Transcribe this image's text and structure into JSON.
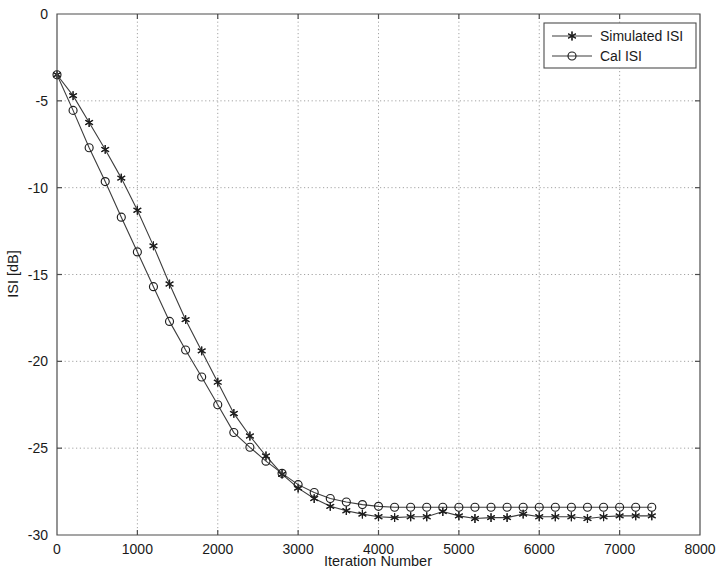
{
  "chart_data": {
    "type": "line",
    "title": "",
    "xlabel": "Iteration Number",
    "ylabel": "ISI [dB]",
    "xlim": [
      0,
      8000
    ],
    "ylim": [
      -30,
      0
    ],
    "xticks": [
      0,
      1000,
      2000,
      3000,
      4000,
      5000,
      6000,
      7000,
      8000
    ],
    "xtick_labels": [
      "0",
      "1000",
      "2000",
      "3000",
      "4000",
      "5000",
      "6000",
      "7000",
      "8000"
    ],
    "yticks": [
      0,
      -5,
      -10,
      -15,
      -20,
      -25,
      -30
    ],
    "ytick_labels": [
      "0",
      "-5",
      "-10",
      "-15",
      "-20",
      "-25",
      "-30"
    ],
    "grid": true,
    "grid_style": "dotted",
    "legend_position": "top-right",
    "line_color": "#3d3d3d",
    "marker_color": "#1f1f1f",
    "marker_interval": 200,
    "series": [
      {
        "name": "Simulated ISI",
        "marker": "star",
        "x": [
          0,
          200,
          400,
          600,
          800,
          1000,
          1200,
          1400,
          1600,
          1800,
          2000,
          2200,
          2400,
          2600,
          2800,
          3000,
          3200,
          3400,
          3600,
          3800,
          4000,
          4200,
          4400,
          4600,
          4800,
          5000,
          5200,
          5400,
          5600,
          5800,
          6000,
          6200,
          6400,
          6600,
          6800,
          7000,
          7200,
          7400
        ],
        "values": [
          -3.5,
          -4.7,
          -6.25,
          -7.8,
          -9.45,
          -11.3,
          -13.35,
          -15.55,
          -17.6,
          -19.4,
          -21.2,
          -23.0,
          -24.3,
          -25.45,
          -26.5,
          -27.3,
          -27.9,
          -28.35,
          -28.6,
          -28.8,
          -28.95,
          -29.0,
          -28.95,
          -28.95,
          -28.65,
          -28.9,
          -29.05,
          -29.0,
          -29.0,
          -28.8,
          -28.95,
          -28.95,
          -28.95,
          -29.05,
          -28.95,
          -28.9,
          -28.9,
          -28.9
        ]
      },
      {
        "name": "Cal ISI",
        "marker": "circle",
        "x": [
          0,
          200,
          400,
          600,
          800,
          1000,
          1200,
          1400,
          1600,
          1800,
          2000,
          2200,
          2400,
          2600,
          2800,
          3000,
          3200,
          3400,
          3600,
          3800,
          4000,
          4200,
          4400,
          4600,
          4800,
          5000,
          5200,
          5400,
          5600,
          5800,
          6000,
          6200,
          6400,
          6600,
          6800,
          7000,
          7200,
          7400
        ],
        "values": [
          -3.5,
          -5.55,
          -7.7,
          -9.65,
          -11.7,
          -13.7,
          -15.7,
          -17.7,
          -19.35,
          -20.9,
          -22.5,
          -24.1,
          -24.95,
          -25.75,
          -26.45,
          -27.1,
          -27.55,
          -27.9,
          -28.1,
          -28.25,
          -28.35,
          -28.4,
          -28.4,
          -28.4,
          -28.4,
          -28.4,
          -28.4,
          -28.4,
          -28.4,
          -28.4,
          -28.4,
          -28.4,
          -28.4,
          -28.4,
          -28.4,
          -28.4,
          -28.4,
          -28.4
        ]
      }
    ]
  },
  "legend": {
    "entries": [
      {
        "label": "Simulated ISI",
        "marker": "star"
      },
      {
        "label": "Cal ISI",
        "marker": "circle"
      }
    ]
  },
  "axes": {
    "x_title": "Iteration Number",
    "y_title": "ISI [dB]"
  }
}
